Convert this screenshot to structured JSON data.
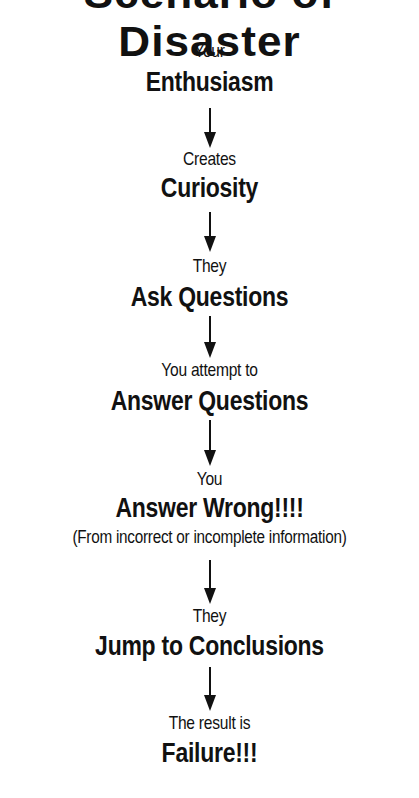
{
  "title": "Scenario of Disaster",
  "steps": [
    {
      "lead": "Your",
      "main": "Enthusiasm"
    },
    {
      "lead": "Creates",
      "main": "Curiosity"
    },
    {
      "lead": "They",
      "main": "Ask Questions"
    },
    {
      "lead": "You attempt to",
      "main": "Answer Questions"
    },
    {
      "lead": "You",
      "main": "Answer Wrong!!!!",
      "note": "(From incorrect or incomplete information)"
    },
    {
      "lead": "They",
      "main": "Jump to Conclusions"
    },
    {
      "lead": "The result is",
      "main": "Failure!!!"
    }
  ],
  "arrow_icon": "down-arrow-icon"
}
